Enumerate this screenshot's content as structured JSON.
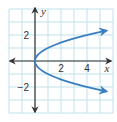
{
  "chart_data": {
    "type": "line",
    "title": "",
    "xlabel": "x",
    "ylabel": "y",
    "xlim": [
      -2,
      6
    ],
    "ylim": [
      -4,
      4
    ],
    "grid": true,
    "x_ticks": [
      {
        "value": 2,
        "label": "2"
      },
      {
        "value": 4,
        "label": "4"
      }
    ],
    "y_ticks": [
      {
        "value": 2,
        "label": "2"
      },
      {
        "value": -2,
        "label": "−2"
      }
    ],
    "series": [
      {
        "name": "upper branch (y = √x)",
        "x": [
          0,
          0.25,
          0.5,
          1,
          2,
          3,
          4,
          5,
          5.5
        ],
        "y": [
          0,
          0.5,
          0.71,
          1,
          1.41,
          1.73,
          2,
          2.24,
          2.35
        ],
        "color": "#3a7ec2",
        "arrow_end": true
      },
      {
        "name": "lower branch (y = −√x)",
        "x": [
          0,
          0.25,
          0.5,
          1,
          2,
          3,
          4,
          5,
          5.5
        ],
        "y": [
          0,
          -0.5,
          -0.71,
          -1,
          -1.41,
          -1.73,
          -2,
          -2.24,
          -2.35
        ],
        "color": "#3a7ec2",
        "arrow_end": true
      }
    ],
    "colors": {
      "grid": "#bfe3ec",
      "axis": "#333333",
      "curve": "#3a7ec2"
    }
  }
}
